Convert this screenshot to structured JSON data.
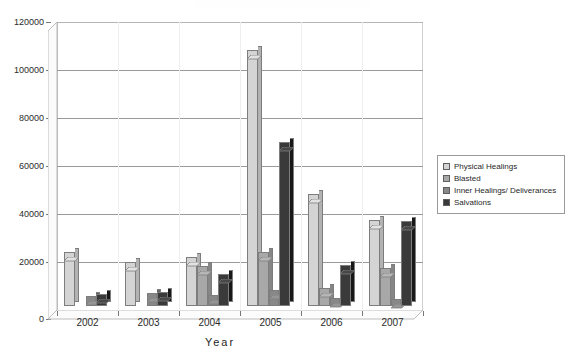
{
  "chart_data": {
    "type": "bar",
    "title": "",
    "xlabel": "Year",
    "ylabel": "",
    "categories": [
      "2002",
      "2003",
      "2004",
      "2005",
      "2006",
      "2007"
    ],
    "ylim": [
      0,
      120000
    ],
    "ytick_labels": [
      "0",
      "20000",
      "40000",
      "60000",
      "80000",
      "100000",
      "120000"
    ],
    "ytick_values": [
      0,
      20000,
      40000,
      60000,
      80000,
      100000,
      120000
    ],
    "grid": true,
    "legend_position": "right",
    "style": "3d-clustered-column",
    "series": [
      {
        "name": "Physical Healings",
        "color": "#d4d4d4",
        "values": [
          22500,
          18500,
          20500,
          106500,
          46500,
          36000
        ]
      },
      {
        "name": "Blasted",
        "color": "#a8a8a8",
        "values": [
          0,
          0,
          16500,
          22500,
          7500,
          16000
        ]
      },
      {
        "name": "Inner Healings/ Deliverances",
        "color": "#888888",
        "values": [
          4000,
          5500,
          4500,
          6500,
          3500,
          3000
        ]
      },
      {
        "name": "Salvations",
        "color": "#3a3a3a",
        "values": [
          5000,
          6000,
          13500,
          68500,
          17000,
          35500
        ]
      }
    ]
  },
  "legend": {
    "items": [
      {
        "label": "Physical Healings",
        "color": "#d4d4d4"
      },
      {
        "label": "Blasted",
        "color": "#a8a8a8"
      },
      {
        "label": "Inner Healings/ Deliverances",
        "color": "#888888"
      },
      {
        "label": "Salvations",
        "color": "#3a3a3a"
      }
    ]
  },
  "axes": {
    "x_title": "Year"
  }
}
